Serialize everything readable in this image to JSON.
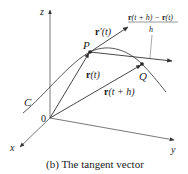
{
  "figure": {
    "caption": "(b) The tangent vector",
    "axes": {
      "x_label": "x",
      "y_label": "y",
      "z_label": "z",
      "origin_label": "0"
    },
    "points": {
      "P": "P",
      "Q": "Q"
    },
    "curve_label": "C",
    "vectors": {
      "r_t": {
        "bold": "r",
        "rest": "(t)"
      },
      "r_t_h": {
        "bold": "r",
        "rest": "(t + h)"
      },
      "r_prime": {
        "bold": "r",
        "rest": "′(t)"
      },
      "secant": {
        "numerator_bold1": "r",
        "numerator_rest1": "(t + h) − ",
        "numerator_bold2": "r",
        "numerator_rest2": "(t)",
        "denominator": "h"
      }
    },
    "colors": {
      "line": "#333333",
      "text": "#222222"
    }
  }
}
